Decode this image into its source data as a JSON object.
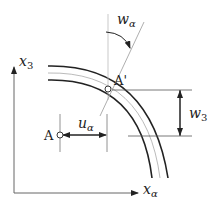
{
  "diagram": {
    "type": "shell-displacement-sketch",
    "axes": {
      "vertical": {
        "label": "x",
        "subscript": "3"
      },
      "horizontal": {
        "label": "x",
        "subscript": "α"
      }
    },
    "points": {
      "original": {
        "label": "A"
      },
      "displaced": {
        "label": "A'"
      }
    },
    "displacements": {
      "in_plane": {
        "label": "u",
        "subscript": "α"
      },
      "rotation": {
        "label": "w",
        "subscript": "α"
      },
      "transverse": {
        "label": "w",
        "subscript": "3"
      }
    },
    "colors": {
      "line": "#222222",
      "thin_line": "#999999"
    }
  }
}
